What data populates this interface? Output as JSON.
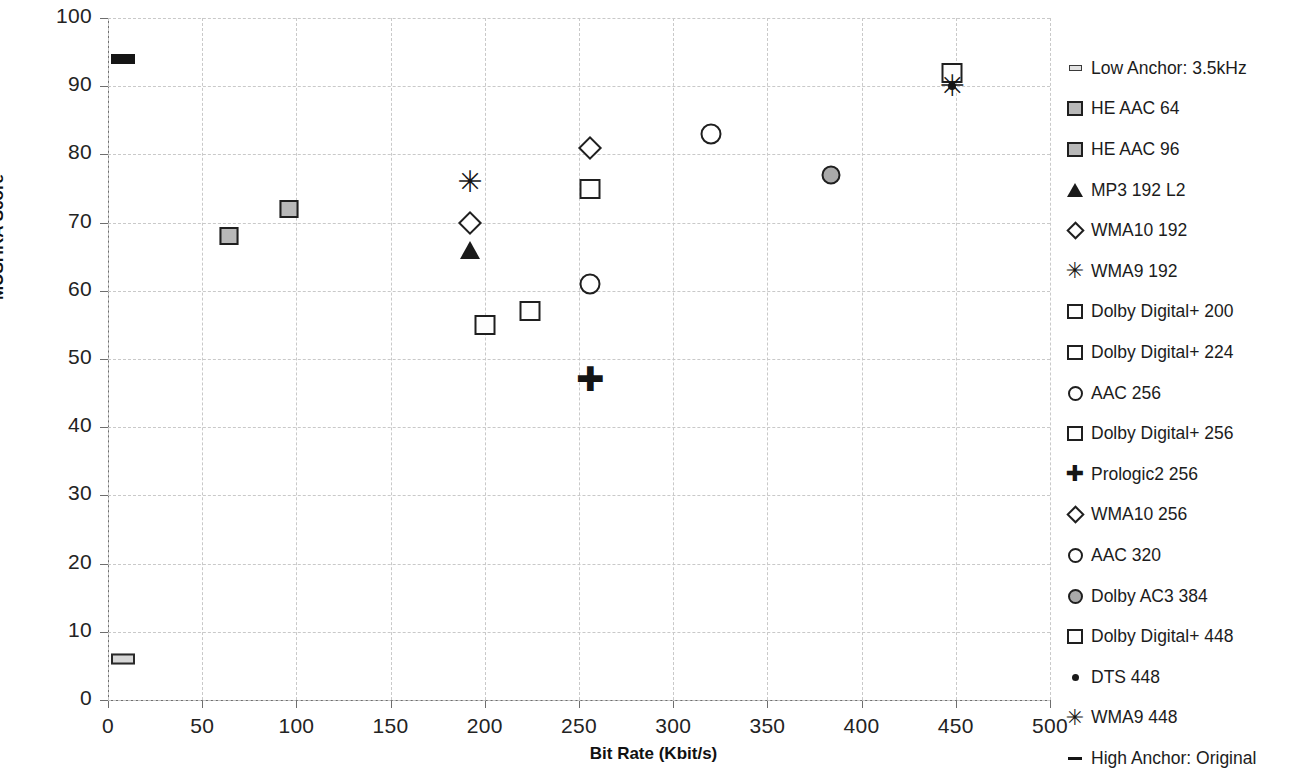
{
  "chart_data": {
    "type": "scatter",
    "title": "",
    "xlabel": "Bit Rate (Kbit/s)",
    "ylabel": "MUSHRA Score",
    "xlim": [
      0,
      500
    ],
    "ylim": [
      0,
      100
    ],
    "xticks": [
      0,
      50,
      100,
      150,
      200,
      250,
      300,
      350,
      400,
      450,
      500
    ],
    "yticks": [
      0,
      10,
      20,
      30,
      40,
      50,
      60,
      70,
      80,
      90,
      100
    ],
    "grid": true,
    "legend_position": "right",
    "series": [
      {
        "name": "Low Anchor: 3.5kHz",
        "marker": "dash-light",
        "x": 8,
        "y": 6
      },
      {
        "name": "HE AAC 64",
        "marker": "sq-gray",
        "x": 64,
        "y": 68
      },
      {
        "name": "HE AAC 96",
        "marker": "sq-gray",
        "x": 96,
        "y": 72
      },
      {
        "name": "MP3 192 L2",
        "marker": "tri",
        "x": 192,
        "y": 66
      },
      {
        "name": "WMA10 192",
        "marker": "diam",
        "x": 192,
        "y": 70
      },
      {
        "name": "WMA9 192",
        "marker": "asterisk",
        "x": 192,
        "y": 76
      },
      {
        "name": "Dolby Digital+ 200",
        "marker": "sq-open",
        "x": 200,
        "y": 55
      },
      {
        "name": "Dolby Digital+ 224",
        "marker": "sq-open",
        "x": 224,
        "y": 57
      },
      {
        "name": "AAC 256",
        "marker": "circ-open",
        "x": 256,
        "y": 61
      },
      {
        "name": "Dolby Digital+ 256",
        "marker": "sq-open",
        "x": 256,
        "y": 75
      },
      {
        "name": "Prologic2 256",
        "marker": "plus",
        "x": 256,
        "y": 47
      },
      {
        "name": "WMA10 256",
        "marker": "diam",
        "x": 256,
        "y": 81
      },
      {
        "name": "AAC 320",
        "marker": "circ-open",
        "x": 320,
        "y": 83
      },
      {
        "name": "Dolby AC3 384",
        "marker": "circ-gray",
        "x": 384,
        "y": 77
      },
      {
        "name": "Dolby Digital+ 448",
        "marker": "sq-open",
        "x": 448,
        "y": 92
      },
      {
        "name": "DTS 448",
        "marker": "dot",
        "x": 448,
        "y": 90
      },
      {
        "name": "WMA9 448",
        "marker": "asterisk",
        "x": 448,
        "y": 90
      },
      {
        "name": "High Anchor: Original",
        "marker": "dash-dark",
        "x": 8,
        "y": 94
      }
    ]
  },
  "legend": {
    "items": [
      {
        "label": "Low Anchor: 3.5kHz",
        "marker": "dash-light"
      },
      {
        "label": "HE AAC 64",
        "marker": "sq-gray"
      },
      {
        "label": "HE AAC 96",
        "marker": "sq-gray"
      },
      {
        "label": "MP3 192 L2",
        "marker": "tri"
      },
      {
        "label": "WMA10 192",
        "marker": "diam"
      },
      {
        "label": "WMA9 192",
        "marker": "asterisk"
      },
      {
        "label": "Dolby Digital+ 200",
        "marker": "sq-open"
      },
      {
        "label": "Dolby Digital+ 224",
        "marker": "sq-open"
      },
      {
        "label": "AAC 256",
        "marker": "circ-open"
      },
      {
        "label": "Dolby Digital+ 256",
        "marker": "sq-open"
      },
      {
        "label": "Prologic2 256",
        "marker": "plus"
      },
      {
        "label": "WMA10 256",
        "marker": "diam"
      },
      {
        "label": "AAC 320",
        "marker": "circ-open"
      },
      {
        "label": "Dolby AC3 384",
        "marker": "circ-gray"
      },
      {
        "label": "Dolby Digital+ 448",
        "marker": "sq-open"
      },
      {
        "label": "DTS 448",
        "marker": "dot"
      },
      {
        "label": "WMA9 448",
        "marker": "asterisk"
      },
      {
        "label": "High Anchor: Original",
        "marker": "dash-dark"
      }
    ]
  },
  "glyphs": {
    "asterisk": "✳",
    "plus": "✚"
  },
  "colors": {
    "marker_stroke": "#1f1f1f",
    "marker_fill_gray": "#b8b8b8",
    "grid": "#c9c9c9",
    "axis": "#6e6e6e"
  }
}
